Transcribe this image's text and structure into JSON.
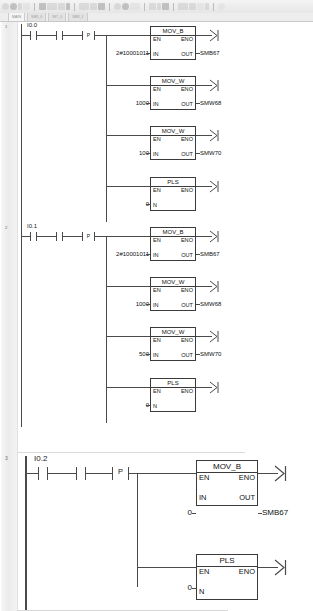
{
  "app": {
    "title": "STEP 7-Micro/WIN - Ladder (LAD) Program Editor"
  },
  "toolbar": {
    "groups": [
      {
        "buttons": [
          "new-icon",
          "open-icon",
          "save-icon",
          "print-icon"
        ]
      },
      {
        "buttons": [
          "cut-icon",
          "copy-icon",
          "paste-icon",
          "undo-icon"
        ]
      },
      {
        "buttons": [
          "compile-icon",
          "download-icon",
          "upload-icon"
        ]
      },
      {
        "buttons": [
          "run-icon",
          "stop-icon",
          "status-chart-icon"
        ]
      },
      {
        "buttons": [
          "zoom-in-icon",
          "zoom-out-icon",
          "grid-icon"
        ]
      },
      {
        "buttons": [
          "contact-icon",
          "coil-icon",
          "box-icon",
          "line-icon"
        ]
      },
      {
        "buttons": [
          "help-icon"
        ]
      }
    ]
  },
  "tabs": {
    "items": [
      {
        "label": "MAIN",
        "active": true
      },
      {
        "label": "SBR_0",
        "active": false
      },
      {
        "label": "INT_0",
        "active": false
      },
      {
        "label": "SBR_1",
        "active": false
      }
    ]
  },
  "colors": {
    "wire": "#4a4a4a",
    "box_border": "#3a3a3a",
    "gutter": "#ececec",
    "text": "#111111"
  },
  "network_labels": {
    "en": "EN",
    "eno": "ENO",
    "in": "IN",
    "out": "OUT",
    "n": "N",
    "p_contact": "P"
  },
  "rungs": [
    {
      "number": "1",
      "contacts": [
        {
          "type": "no-contact",
          "label": "I0.0"
        },
        {
          "type": "no-contact",
          "label": ""
        },
        {
          "type": "p-contact",
          "label": "",
          "inner": "P"
        }
      ],
      "boxes": [
        {
          "name": "MOV_B",
          "in_value": "2#10001011",
          "out_value": "SMB67",
          "in_pin": "IN",
          "out_pin": "OUT"
        },
        {
          "name": "MOV_W",
          "in_value": "1000",
          "out_value": "SMW68",
          "in_pin": "IN",
          "out_pin": "OUT"
        },
        {
          "name": "MOV_W",
          "in_value": "100",
          "out_value": "SMW70",
          "in_pin": "IN",
          "out_pin": "OUT"
        },
        {
          "name": "PLS",
          "in_value": "0",
          "out_value": "",
          "in_pin": "N",
          "out_pin": ""
        }
      ]
    },
    {
      "number": "2",
      "contacts": [
        {
          "type": "no-contact",
          "label": "I0.1"
        },
        {
          "type": "no-contact",
          "label": ""
        },
        {
          "type": "p-contact",
          "label": "",
          "inner": "P"
        }
      ],
      "boxes": [
        {
          "name": "MOV_B",
          "in_value": "2#10001011",
          "out_value": "SMB67",
          "in_pin": "IN",
          "out_pin": "OUT"
        },
        {
          "name": "MOV_W",
          "in_value": "1000",
          "out_value": "SMW68",
          "in_pin": "IN",
          "out_pin": "OUT"
        },
        {
          "name": "MOV_W",
          "in_value": "500",
          "out_value": "SMW70",
          "in_pin": "IN",
          "out_pin": "OUT"
        },
        {
          "name": "PLS",
          "in_value": "0",
          "out_value": "",
          "in_pin": "N",
          "out_pin": ""
        }
      ]
    },
    {
      "number": "3",
      "contacts": [
        {
          "type": "no-contact",
          "label": "I0.2"
        },
        {
          "type": "no-contact",
          "label": ""
        },
        {
          "type": "p-contact",
          "label": "",
          "inner": "P"
        }
      ],
      "boxes": [
        {
          "name": "MOV_B",
          "in_value": "0",
          "out_value": "SMB67",
          "in_pin": "IN",
          "out_pin": "OUT"
        },
        {
          "name": "PLS",
          "in_value": "0",
          "out_value": "",
          "in_pin": "N",
          "out_pin": ""
        }
      ]
    }
  ],
  "caption": ""
}
